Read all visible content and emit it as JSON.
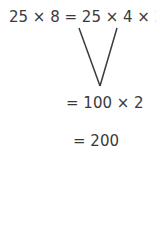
{
  "equation": {
    "line1": "25 × 8 = 25 × 4 × 2",
    "line2": "= 100 × 2",
    "line3": "= 200"
  },
  "colors": {
    "text": "#3a3a3a",
    "lines": "#3a3a3a"
  }
}
